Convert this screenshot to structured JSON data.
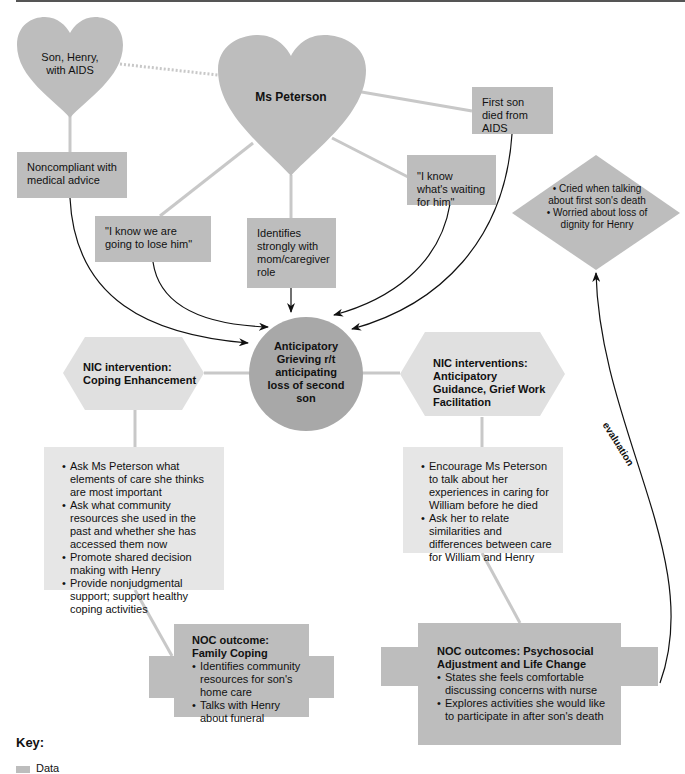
{
  "colors": {
    "data_fill": "#bdbdbd",
    "intervention_fill": "#e6e6e6",
    "connector": "#c8c8c8",
    "arrow": "#111111",
    "top_border": "#555555"
  },
  "nodes": {
    "henry_heart": "Son, Henry, with AIDS",
    "henry_heart_line1": "Son, Henry,",
    "henry_heart_line2": "with AIDS",
    "peterson_heart": "Ms Peterson",
    "noncompliant": "Noncompliant with medical advice",
    "first_son_died": "First son died from AIDS",
    "waiting_for_him": "\"I know what's waiting for him\"",
    "lose_him": "\"I know we are going to lose him\"",
    "identifies": "Identifies strongly with mom/caregiver role",
    "diagnosis": "Anticipatory Grieving r/t anticipating loss of second son",
    "evaluation_diamond": {
      "items": [
        "Cried when talking about first son's death",
        "Worried about loss of dignity for Henry"
      ]
    },
    "nic_left": {
      "title": "NIC intervention: Coping Enhancement",
      "items": [
        "Ask Ms Peterson what elements of care she thinks are most important",
        "Ask what community resources she used in the past and whether she has accessed them now",
        "Promote shared decision making with Henry",
        "Provide nonjudgmental support; support healthy coping activities"
      ]
    },
    "nic_right": {
      "title": "NIC interventions: Anticipatory Guidance, Grief Work Facilitation",
      "items": [
        "Encourage Ms Peterson to talk about her experiences in caring for William before he died",
        "Ask her to relate similarities and differences between care for William and Henry"
      ]
    },
    "noc_left": {
      "title": "NOC outcome: Family Coping",
      "items": [
        "Identifies community resources for son's home care",
        "Talks with Henry about funeral"
      ]
    },
    "noc_right": {
      "title": "NOC outcomes: Psychosocial Adjustment and Life Change",
      "items": [
        "States she feels comfortable discussing concerns with nurse",
        "Explores activities she would like to participate in after son's death"
      ]
    }
  },
  "edges": {
    "evaluation_label": "evaluation"
  },
  "key": {
    "title": "Key:",
    "items": [
      {
        "label": "Data",
        "color": "#bdbdbd"
      }
    ]
  }
}
